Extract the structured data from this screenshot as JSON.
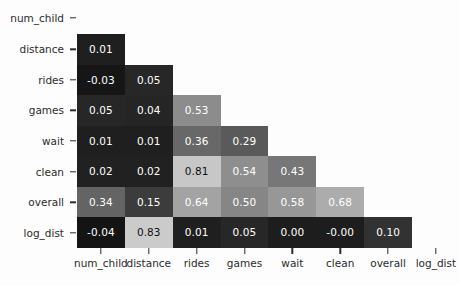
{
  "chart_data": {
    "type": "heatmap",
    "title": "",
    "xlabel": "",
    "ylabel": "",
    "grid": false,
    "legend": "none",
    "colormap": "grayscale",
    "layout": "lower-triangle correlation matrix (diagonal and upper triangle hidden)",
    "categories": [
      "num_child",
      "distance",
      "rides",
      "games",
      "wait",
      "clean",
      "overall",
      "log_dist"
    ],
    "x_tick_labels": [
      "num_child",
      "distance",
      "rides",
      "games",
      "wait",
      "clean",
      "overall",
      "log_dist"
    ],
    "y_tick_labels": [
      "num_child",
      "distance",
      "rides",
      "games",
      "wait",
      "clean",
      "overall",
      "log_dist"
    ],
    "vmin": -0.04,
    "vmax": 0.83,
    "rows": [
      {
        "label": "num_child",
        "cells": []
      },
      {
        "label": "distance",
        "cells": [
          {
            "col": "num_child",
            "value": "0.01",
            "v": 0.01
          }
        ]
      },
      {
        "label": "rides",
        "cells": [
          {
            "col": "num_child",
            "value": "-0.03",
            "v": -0.03
          },
          {
            "col": "distance",
            "value": "0.05",
            "v": 0.05
          }
        ]
      },
      {
        "label": "games",
        "cells": [
          {
            "col": "num_child",
            "value": "0.05",
            "v": 0.05
          },
          {
            "col": "distance",
            "value": "0.04",
            "v": 0.04
          },
          {
            "col": "rides",
            "value": "0.53",
            "v": 0.53
          }
        ]
      },
      {
        "label": "wait",
        "cells": [
          {
            "col": "num_child",
            "value": "0.01",
            "v": 0.01
          },
          {
            "col": "distance",
            "value": "0.01",
            "v": 0.01
          },
          {
            "col": "rides",
            "value": "0.36",
            "v": 0.36
          },
          {
            "col": "games",
            "value": "0.29",
            "v": 0.29
          }
        ]
      },
      {
        "label": "clean",
        "cells": [
          {
            "col": "num_child",
            "value": "0.02",
            "v": 0.02
          },
          {
            "col": "distance",
            "value": "0.02",
            "v": 0.02
          },
          {
            "col": "rides",
            "value": "0.81",
            "v": 0.81
          },
          {
            "col": "games",
            "value": "0.54",
            "v": 0.54
          },
          {
            "col": "wait",
            "value": "0.43",
            "v": 0.43
          }
        ]
      },
      {
        "label": "overall",
        "cells": [
          {
            "col": "num_child",
            "value": "0.34",
            "v": 0.34
          },
          {
            "col": "distance",
            "value": "0.15",
            "v": 0.15
          },
          {
            "col": "rides",
            "value": "0.64",
            "v": 0.64
          },
          {
            "col": "games",
            "value": "0.50",
            "v": 0.5
          },
          {
            "col": "wait",
            "value": "0.58",
            "v": 0.58
          },
          {
            "col": "clean",
            "value": "0.68",
            "v": 0.68
          }
        ]
      },
      {
        "label": "log_dist",
        "cells": [
          {
            "col": "num_child",
            "value": "-0.04",
            "v": -0.04
          },
          {
            "col": "distance",
            "value": "0.83",
            "v": 0.83
          },
          {
            "col": "rides",
            "value": "0.01",
            "v": 0.01
          },
          {
            "col": "games",
            "value": "0.05",
            "v": 0.05
          },
          {
            "col": "wait",
            "value": "0.00",
            "v": 0.0
          },
          {
            "col": "clean",
            "value": "-0.00",
            "v": -0.0
          },
          {
            "col": "overall",
            "value": "0.10",
            "v": 0.1
          }
        ]
      }
    ]
  },
  "colors": {
    "background": "#fdfdfd",
    "tick_text": "#2b2b2b",
    "cell_text_light": "#ffffff",
    "cell_text_dark": "#111111"
  }
}
